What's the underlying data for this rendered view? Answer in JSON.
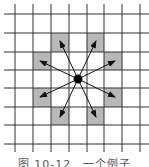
{
  "figure": {
    "caption": "图 10-12　一个例子",
    "colors": {
      "grid": "#333333",
      "shaded": "#b8b8b8",
      "arrow": "#111111",
      "dot": "#000000"
    },
    "grid": {
      "x_lines": [
        15,
        33,
        51,
        69,
        87,
        104,
        122,
        140
      ],
      "y_lines": [
        14,
        33,
        52,
        70,
        88,
        107,
        125,
        144
      ],
      "x_extent": [
        4,
        149
      ],
      "y_extent": [
        4,
        152
      ]
    },
    "center": {
      "x": 78,
      "y": 79,
      "r": 4.5,
      "label": "knight-position"
    },
    "shaded_cells": [
      {
        "x": 51,
        "y": 33,
        "w": 18,
        "h": 19
      },
      {
        "x": 87,
        "y": 33,
        "w": 17,
        "h": 19
      },
      {
        "x": 33,
        "y": 52,
        "w": 18,
        "h": 18
      },
      {
        "x": 104,
        "y": 52,
        "w": 18,
        "h": 18
      },
      {
        "x": 33,
        "y": 88,
        "w": 18,
        "h": 19
      },
      {
        "x": 104,
        "y": 88,
        "w": 18,
        "h": 19
      },
      {
        "x": 51,
        "y": 107,
        "w": 18,
        "h": 18
      },
      {
        "x": 87,
        "y": 107,
        "w": 17,
        "h": 18
      }
    ],
    "arrows": [
      {
        "x": 60,
        "y": 41
      },
      {
        "x": 96,
        "y": 41
      },
      {
        "x": 40,
        "y": 61
      },
      {
        "x": 115,
        "y": 61
      },
      {
        "x": 40,
        "y": 97
      },
      {
        "x": 115,
        "y": 97
      },
      {
        "x": 60,
        "y": 117
      },
      {
        "x": 96,
        "y": 117
      }
    ]
  }
}
